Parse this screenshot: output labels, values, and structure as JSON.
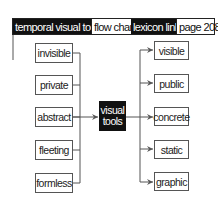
{
  "header": {
    "segments": [
      {
        "label": "temporal visual tool",
        "style": "dark"
      },
      {
        "label": "flow chart",
        "style": "light"
      },
      {
        "label": "lexicon link",
        "style": "dark"
      },
      {
        "label": "page 208",
        "style": "light"
      }
    ]
  },
  "diagram": {
    "left_nodes": [
      "invisible",
      "private",
      "abstract",
      "fleeting",
      "formless"
    ],
    "center_node": {
      "line1": "visual",
      "line2": "tools"
    },
    "right_nodes": [
      "visible",
      "public",
      "concrete",
      "static",
      "graphic"
    ]
  },
  "colors": {
    "dark": "#111111",
    "line": "#555555",
    "background": "#ffffff"
  }
}
